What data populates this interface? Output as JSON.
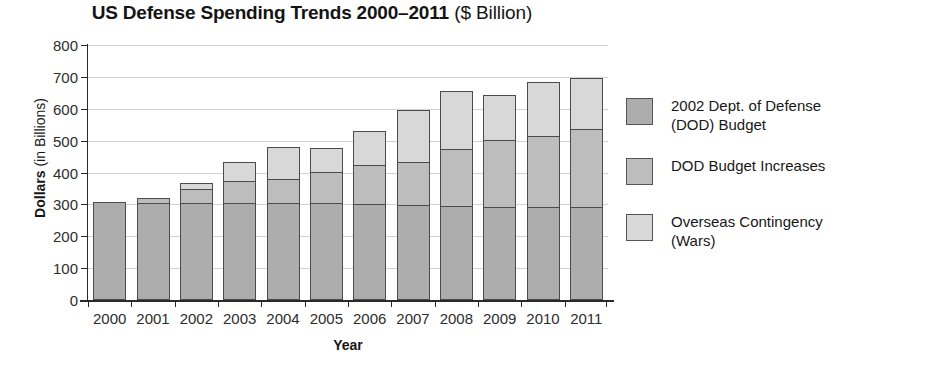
{
  "chart_data": {
    "type": "bar",
    "subtype": "stacked",
    "title_main": "US Defense Spending Trends 2000–2011",
    "title_sub": "($ Billion)",
    "xlabel": "Year",
    "ylabel_bold": "Dollars",
    "ylabel_rest": " (in Billions)",
    "ylabel_full": "Dollars (in Billions)",
    "categories": [
      "2000",
      "2001",
      "2002",
      "2003",
      "2004",
      "2005",
      "2006",
      "2007",
      "2008",
      "2009",
      "2010",
      "2011"
    ],
    "ylim": [
      0,
      800
    ],
    "yticks": [
      0,
      100,
      200,
      300,
      400,
      500,
      600,
      700,
      800
    ],
    "grid": true,
    "legend_position": "right",
    "series": [
      {
        "name": "2002 Dept. of Defense (DOD) Budget",
        "color": "#adadad",
        "values": [
          305,
          300,
          300,
          300,
          300,
          300,
          298,
          295,
          293,
          290,
          290,
          290
        ]
      },
      {
        "name": "DOD Budget Increases",
        "color": "#bdbdbd",
        "values": [
          0,
          18,
          45,
          70,
          77,
          100,
          122,
          135,
          178,
          208,
          220,
          243
        ]
      },
      {
        "name": "Overseas Contingency (Wars)",
        "color": "#d8d8d8",
        "values": [
          0,
          0,
          20,
          60,
          100,
          75,
          107,
          163,
          182,
          142,
          172,
          160
        ]
      }
    ],
    "totals": [
      305,
      318,
      365,
      430,
      477,
      475,
      527,
      593,
      653,
      640,
      682,
      693
    ]
  },
  "legend": {
    "entries": [
      {
        "label_line1": "2002 Dept. of Defense",
        "label_line2": "(DOD) Budget",
        "swatch": "#adadad"
      },
      {
        "label_line1": "DOD Budget Increases",
        "label_line2": "",
        "swatch": "#bdbdbd"
      },
      {
        "label_line1": "Overseas Contingency",
        "label_line2": "(Wars)",
        "swatch": "#d8d8d8"
      }
    ]
  }
}
